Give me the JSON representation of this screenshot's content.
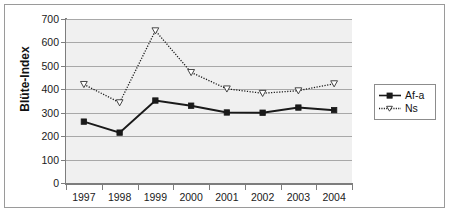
{
  "chart_data": {
    "type": "line",
    "title": "",
    "xlabel": "",
    "ylabel": "Blüte-Index",
    "categories": [
      "1997",
      "1998",
      "1999",
      "2000",
      "2001",
      "2002",
      "2003",
      "2004"
    ],
    "x": [
      1997,
      1998,
      1999,
      2000,
      2001,
      2002,
      2003,
      2004
    ],
    "ylim": [
      0,
      700
    ],
    "yticks": [
      0,
      100,
      200,
      300,
      400,
      500,
      600,
      700
    ],
    "ytick_labels": [
      "0",
      "100",
      "200",
      "300",
      "400",
      "500",
      "600",
      "700"
    ],
    "grid": true,
    "legend_position": "right",
    "series": [
      {
        "name": "Af-a",
        "values": [
          262,
          215,
          352,
          330,
          301,
          300,
          322,
          311
        ],
        "color": "#1a1a1a",
        "linestyle": "solid",
        "marker": "square"
      },
      {
        "name": "Ns",
        "values": [
          421,
          343,
          650,
          472,
          402,
          383,
          394,
          424
        ],
        "color": "#1a1a1a",
        "linestyle": "dotted",
        "marker": "triangle-down"
      }
    ]
  },
  "legend": {
    "items": [
      {
        "label": "Af-a"
      },
      {
        "label": "Ns"
      }
    ]
  },
  "axes": {
    "y_axis_title": "Blüte-Index"
  }
}
